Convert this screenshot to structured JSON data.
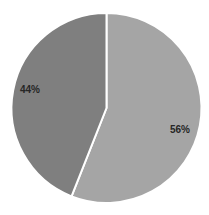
{
  "chart_data": {
    "type": "pie",
    "title": "",
    "categories": [
      "Slice A",
      "Slice B"
    ],
    "values": [
      56,
      44
    ],
    "labels": [
      "56%",
      "44%"
    ],
    "colors": [
      "#a5a5a5",
      "#7f7f7f"
    ],
    "start_angle": "12 o'clock",
    "direction": "clockwise",
    "legend": "none",
    "separator_color": "#ffffff"
  }
}
